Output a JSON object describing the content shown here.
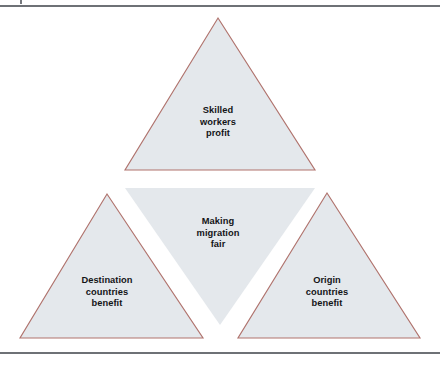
{
  "figure": {
    "title": "Making migration fair",
    "kind": "triforce-triangle-diagram",
    "colors": {
      "triangle_fill": "#e4e8ec",
      "triangle_stroke": "#b0736d",
      "text": "#131417",
      "page_rule": "#6e7176",
      "background": "#ffffff"
    },
    "triangles": [
      {
        "id": "top",
        "name": "skilled-workers",
        "orientation": "upright",
        "outlined": true,
        "label": "Skilled\nworkers\nprofit"
      },
      {
        "id": "center",
        "name": "making-migration-fair",
        "orientation": "inverted",
        "outlined": false,
        "label": "Making\nmigration\nfair"
      },
      {
        "id": "bottom-left",
        "name": "destination-countries",
        "orientation": "upright",
        "outlined": true,
        "label": "Destination\ncountries\nbenefit"
      },
      {
        "id": "bottom-right",
        "name": "origin-countries",
        "orientation": "upright",
        "outlined": true,
        "label": "Origin\ncountries\nbenefit"
      }
    ]
  }
}
